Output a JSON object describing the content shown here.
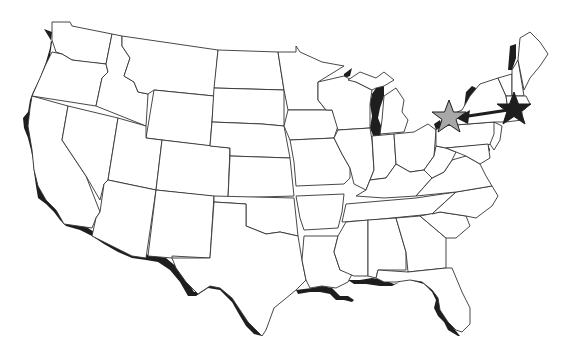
{
  "map": {
    "title": "United States outline map",
    "region": "Contiguous United States",
    "style": "black-and-white state outline with shaded coastlines",
    "colors": {
      "background": "#ffffff",
      "state_fill": "#ffffff",
      "state_border": "#333333",
      "coast_shadow": "#1e1e1e",
      "origin_star": "#1e1e1e",
      "destination_star": "#a8a8a8",
      "arrow": "#1e1e1e"
    },
    "markers": [
      {
        "id": "origin",
        "symbol": "star",
        "color": "black",
        "location": "Massachusetts / southern New England",
        "x": 514,
        "y": 110
      },
      {
        "id": "destination",
        "symbol": "star",
        "color": "gray",
        "location": "Western New York / Lake Erie area",
        "x": 449,
        "y": 118
      }
    ],
    "route": {
      "from": "origin",
      "to": "destination",
      "type": "arrow"
    }
  }
}
